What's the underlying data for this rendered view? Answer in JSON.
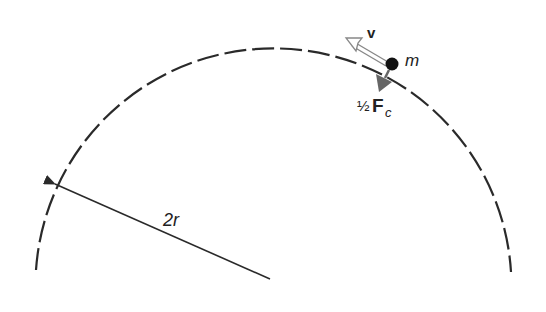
{
  "diagram": {
    "type": "circular-motion",
    "labels": {
      "velocity": "v",
      "mass": "m",
      "force_prefix": "½",
      "force_symbol": "F",
      "force_subscript": "c",
      "radius": "2r"
    },
    "geometry": {
      "center": [
        272,
        280
      ],
      "radius": 238,
      "arc_style": "dashed",
      "mass_position": [
        392,
        64
      ]
    },
    "colors": {
      "line": "#2a2a2a",
      "force_arrow": "#666666",
      "velocity_arrow": "#888888",
      "mass": "#111111"
    }
  }
}
